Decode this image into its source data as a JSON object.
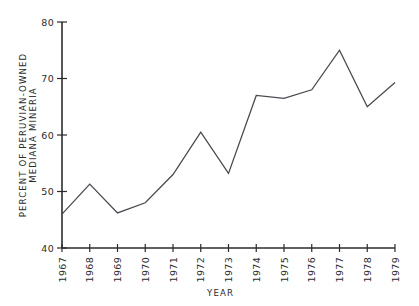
{
  "chart_data": {
    "type": "line",
    "title": "",
    "xlabel": "YEAR",
    "ylabel": "PERCENT OF PERUVIAN-OWNED MEDIANA MINERIA",
    "ylabel_line1": "PERCENT OF PERUVIAN-OWNED",
    "ylabel_line2": "MEDIANA MINERIA",
    "categories": [
      "1967",
      "1968",
      "1969",
      "1970",
      "1971",
      "1972",
      "1973",
      "1974",
      "1975",
      "1976",
      "1977",
      "1978",
      "1979"
    ],
    "values": [
      46.0,
      51.3,
      46.2,
      48.0,
      53.0,
      60.5,
      53.2,
      67.0,
      66.5,
      68.0,
      75.0,
      65.0,
      69.3
    ],
    "series": [
      {
        "name": "Percent of Peruvian-owned Mediana Mineria",
        "values": [
          46.0,
          51.3,
          46.2,
          48.0,
          53.0,
          60.5,
          53.2,
          67.0,
          66.5,
          68.0,
          75.0,
          65.0,
          69.3
        ]
      }
    ],
    "ylim": [
      40,
      80
    ],
    "y_ticks": [
      40,
      50,
      60,
      70,
      80
    ],
    "y_tick_labels": [
      "40",
      "50",
      "60",
      "70",
      "80"
    ],
    "x_tick_labels": [
      "1967",
      "1968",
      "1969",
      "1970",
      "1971",
      "1972",
      "1973",
      "1974",
      "1975",
      "1976",
      "1977",
      "1978",
      "1979"
    ],
    "grid": false,
    "legend": false,
    "legend_position": "none",
    "line_color": "#4a4a52",
    "axis_color": "#2b2b2b",
    "background_color": "#ffffff",
    "x_tick_rotation": -90,
    "annotations": []
  }
}
